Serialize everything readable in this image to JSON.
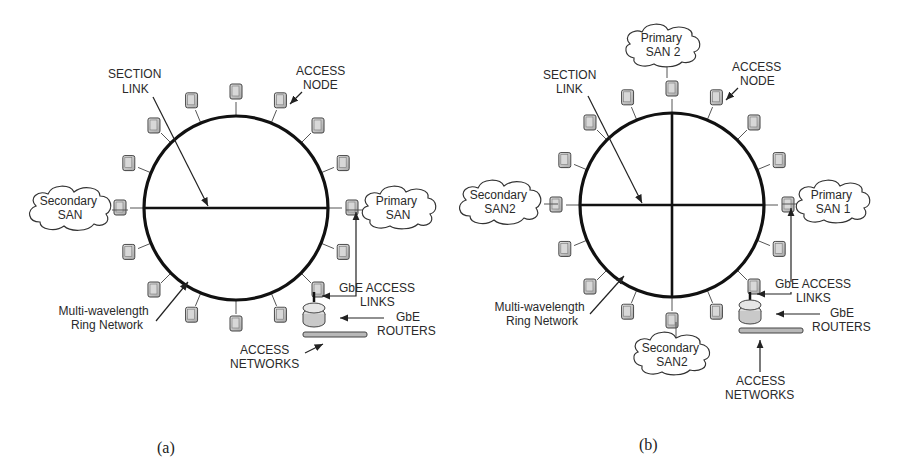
{
  "figure": {
    "panels": [
      {
        "id": "a",
        "caption": "(a)",
        "labels": {
          "section_link": [
            "SECTION",
            "LINK"
          ],
          "access_node": [
            "ACCESS",
            "NODE"
          ],
          "primary_san": [
            "Primary",
            "SAN"
          ],
          "secondary_san": [
            "Secondary",
            "SAN"
          ],
          "ring": [
            "Multi-wavelength",
            "Ring Network"
          ],
          "gbe_access_links": [
            "GbE ACCESS",
            "LINKS"
          ],
          "gbe_routers": [
            "GbE",
            "ROUTERS"
          ],
          "access_networks": [
            "ACCESS",
            "NETWORKS"
          ]
        }
      },
      {
        "id": "b",
        "caption": "(b)",
        "labels": {
          "section_link": [
            "SECTION",
            "LINK"
          ],
          "access_node": [
            "ACCESS",
            "NODE"
          ],
          "primary_san_top": [
            "Primary",
            "SAN 2"
          ],
          "primary_san_right": [
            "Primary",
            "SAN 1"
          ],
          "secondary_san_left": [
            "Secondary",
            "SAN2"
          ],
          "secondary_san_bottom": [
            "Secondary",
            "SAN2"
          ],
          "ring": [
            "Multi-wavelength",
            "Ring Network"
          ],
          "gbe_access_links": [
            "GbE ACCESS",
            "LINKS"
          ],
          "gbe_routers": [
            "GbE",
            "ROUTERS"
          ],
          "access_networks": [
            "ACCESS",
            "NETWORKS"
          ]
        }
      }
    ]
  }
}
